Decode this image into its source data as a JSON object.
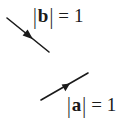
{
  "diagram": {
    "vectors": [
      {
        "name": "b",
        "label_symbol": "b",
        "label_equals": "=",
        "label_value": "1",
        "from": [
          7,
          18
        ],
        "to": [
          49,
          52
        ],
        "arrow_at": [
          29,
          36
        ],
        "direction": "down-right"
      },
      {
        "name": "a",
        "label_symbol": "a",
        "label_equals": "=",
        "label_value": "1",
        "from": [
          41,
          100
        ],
        "to": [
          88,
          73
        ],
        "arrow_at": [
          66,
          86
        ],
        "direction": "up-right"
      }
    ],
    "line_color": "#1a1a1a"
  }
}
